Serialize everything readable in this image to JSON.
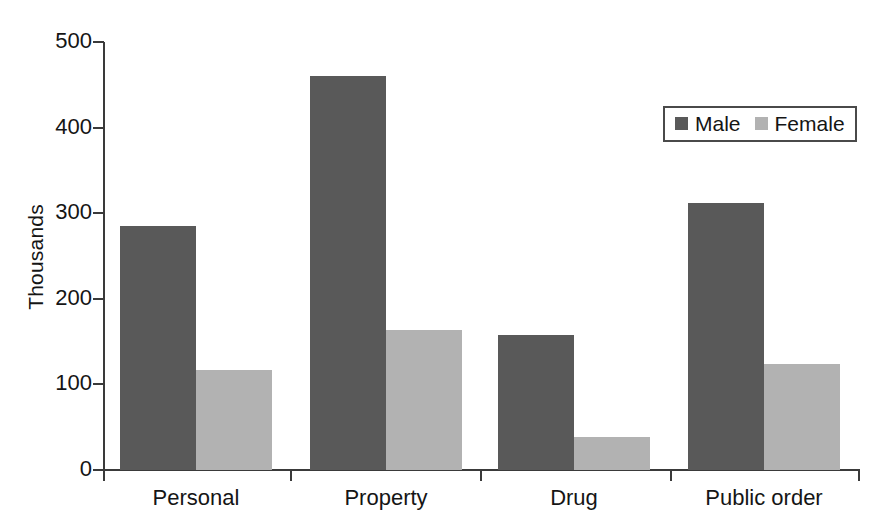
{
  "chart_data": {
    "type": "bar",
    "title": "",
    "subtitle": "",
    "xlabel": "",
    "ylabel": "Thousands",
    "categories": [
      "Personal",
      "Property",
      "Drug",
      "Public order"
    ],
    "series": [
      {
        "name": "Male",
        "color": "#595959",
        "values": [
          285,
          460,
          158,
          312
        ]
      },
      {
        "name": "Female",
        "color": "#b2b2b2",
        "values": [
          117,
          163,
          39,
          124
        ]
      }
    ],
    "ylim": [
      0,
      500
    ],
    "ytick_values": [
      0,
      100,
      200,
      300,
      400,
      500
    ],
    "ytick_labels": [
      "0",
      "100",
      "200",
      "300",
      "400",
      "500"
    ],
    "grid": false,
    "legend_position": "top-right",
    "legend_entries": [
      "Male",
      "Female"
    ],
    "orientation": "vertical",
    "bar_grouping": "grouped"
  },
  "legend": {
    "items": [
      {
        "label": "Male",
        "swatch": "male"
      },
      {
        "label": "Female",
        "swatch": "female"
      }
    ]
  },
  "axes": {
    "y_title": "Thousands",
    "y_ticks": [
      "500",
      "400",
      "300",
      "200",
      "100",
      "0"
    ],
    "x_ticks": [
      "Personal",
      "Property",
      "Drug",
      "Public order"
    ]
  }
}
